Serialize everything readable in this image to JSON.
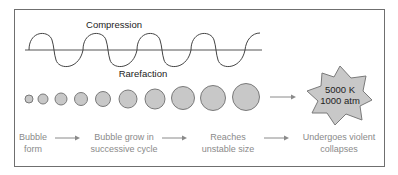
{
  "diagram": {
    "wave": {
      "top_label": "Compression",
      "bottom_label": "Rarefaction"
    },
    "bubbles": {
      "count": 10,
      "radii": [
        4,
        5,
        6,
        6.5,
        7.5,
        9,
        10,
        11.5,
        12.5,
        13.5
      ],
      "fill": "#c8c8c8",
      "stroke": "#7a7a7a"
    },
    "star": {
      "line1": "5000 K",
      "line2": "1000 atm",
      "fill": "#c8c8c8"
    },
    "stages": [
      {
        "line1": "Bubble",
        "line2": "form"
      },
      {
        "line1": "Bubble grow in",
        "line2": "successive cycle"
      },
      {
        "line1": "Reaches",
        "line2": "unstable size"
      },
      {
        "line1": "Undergoes violent",
        "line2": "collapses"
      }
    ],
    "colors": {
      "line": "#555555",
      "arrow": "#8a8a8a",
      "caption": "#8a8a8a",
      "border": "#6f6f6f"
    }
  }
}
